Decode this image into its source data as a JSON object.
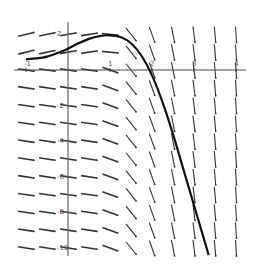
{
  "chart_data": {
    "type": "line",
    "subtype": "slope-field",
    "title": "",
    "xlabel": "",
    "ylabel": "",
    "xlim": [
      -1.1,
      4.2
    ],
    "ylim": [
      -10.5,
      2.5
    ],
    "grid": false,
    "legend": null,
    "x_ticks": [
      "-1",
      "1",
      "2",
      "3",
      "4"
    ],
    "y_ticks": [
      "2",
      "-2",
      "-4",
      "-6",
      "-8",
      "-10"
    ],
    "slope_field": {
      "x_samples": [
        -1,
        -0.5,
        0,
        0.5,
        1,
        1.5,
        2,
        2.5,
        3,
        3.5,
        4
      ],
      "y_samples": [
        2,
        1,
        0,
        -1,
        -2,
        -3,
        -4,
        -5,
        -6,
        -7,
        -8,
        -9,
        -10
      ],
      "color": "#333333"
    },
    "solution_curve": {
      "color": "#111111",
      "points": [
        [
          -1,
          0.6
        ],
        [
          -0.75,
          0.65
        ],
        [
          -0.5,
          0.75
        ],
        [
          -0.25,
          0.95
        ],
        [
          0,
          1.2
        ],
        [
          0.25,
          1.5
        ],
        [
          0.5,
          1.75
        ],
        [
          0.75,
          1.9
        ],
        [
          1,
          1.95
        ],
        [
          1.25,
          1.85
        ],
        [
          1.5,
          1.5
        ],
        [
          1.75,
          0.8
        ],
        [
          2,
          -0.3
        ],
        [
          2.25,
          -1.8
        ],
        [
          2.5,
          -3.6
        ],
        [
          2.75,
          -5.6
        ],
        [
          3,
          -7.6
        ],
        [
          3.25,
          -9.6
        ],
        [
          3.35,
          -10.4
        ]
      ]
    }
  }
}
